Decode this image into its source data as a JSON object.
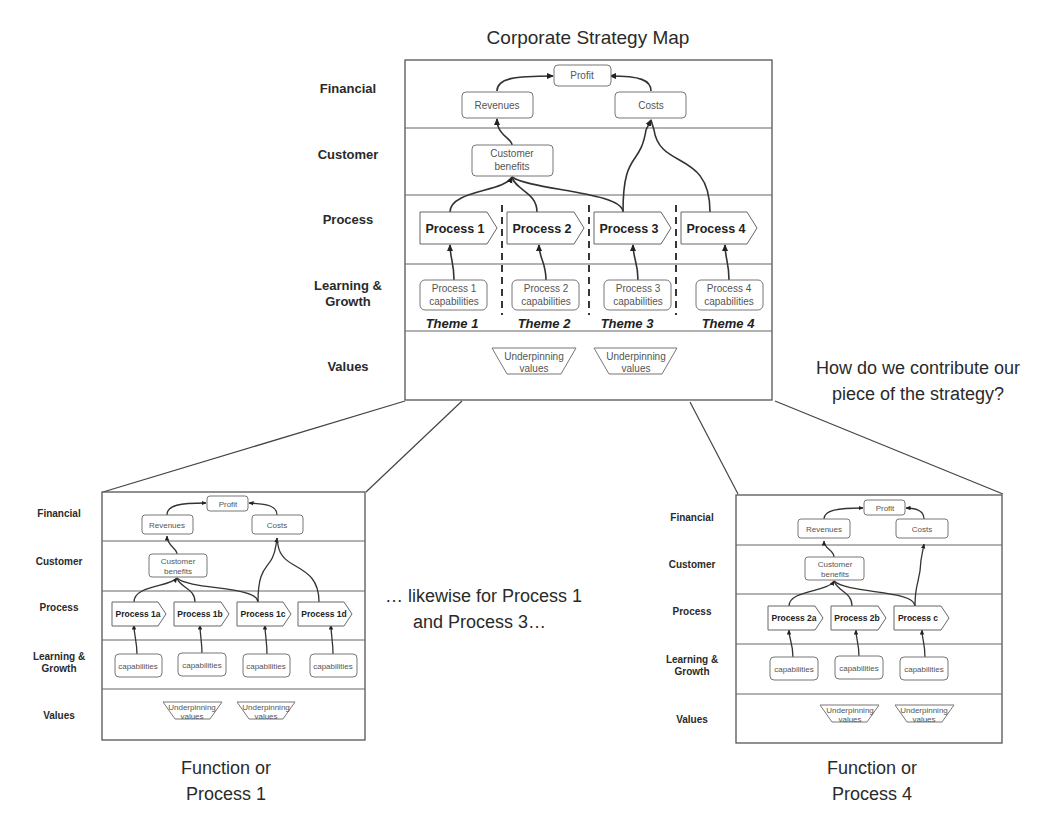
{
  "title": "Corporate Strategy Map",
  "question": [
    "How do we contribute our",
    "piece of the strategy?"
  ],
  "likewise_note": [
    "… likewise for Process 1",
    "and Process 3…"
  ],
  "main_map": {
    "rows": [
      "Financial",
      "Customer",
      "Process",
      "Learning &",
      "Growth",
      "Values"
    ],
    "financial": {
      "profit": "Profit",
      "revenues": "Revenues",
      "costs": "Costs"
    },
    "customer": {
      "benefits_line1": "Customer",
      "benefits_line2": "benefits"
    },
    "processes": [
      "Process 1",
      "Process 2",
      "Process 3",
      "Process 4"
    ],
    "capabilities": [
      [
        "Process 1",
        "capabilities"
      ],
      [
        "Process 2",
        "capabilities"
      ],
      [
        "Process 3",
        "capabilities"
      ],
      [
        "Process 4",
        "capabilities"
      ]
    ],
    "themes": [
      "Theme 1",
      "Theme 2",
      "Theme 3",
      "Theme 4"
    ],
    "values": [
      [
        "Underpinning",
        "values"
      ],
      [
        "Underpinning",
        "values"
      ]
    ]
  },
  "sub_map_left": {
    "caption": [
      "Function or",
      "Process 1"
    ],
    "rows": [
      "Financial",
      "Customer",
      "Process",
      "Learning &",
      "Growth",
      "Values"
    ],
    "financial": {
      "profit": "Profit",
      "revenues": "Revenues",
      "costs": "Costs"
    },
    "customer": {
      "benefits_line1": "Customer",
      "benefits_line2": "benefits"
    },
    "processes": [
      "Process 1a",
      "Process 1b",
      "Process 1c",
      "Process 1d"
    ],
    "capabilities": [
      "capabilities",
      "capabilities",
      "capabilities",
      "capabilities"
    ],
    "values": [
      [
        "Underpinning",
        "values"
      ],
      [
        "Underpinning",
        "values"
      ]
    ]
  },
  "sub_map_right": {
    "caption": [
      "Function or",
      "Process 4"
    ],
    "rows": [
      "Financial",
      "Customer",
      "Process",
      "Learning &",
      "Growth",
      "Values"
    ],
    "financial": {
      "profit": "Profit",
      "revenues": "Revenues",
      "costs": "Costs"
    },
    "customer": {
      "benefits_line1": "Customer",
      "benefits_line2": "benefits"
    },
    "processes": [
      "Process 2a",
      "Process 2b",
      "Process c"
    ],
    "capabilities": [
      "capabilities",
      "capabilities",
      "capabilities"
    ],
    "values": [
      [
        "Underpinning",
        "values"
      ],
      [
        "Underpinning",
        "values"
      ]
    ]
  },
  "colors": {
    "line": "#333333",
    "frame": "#555555",
    "node_border": "#777777",
    "text": "#2a2a2a"
  }
}
